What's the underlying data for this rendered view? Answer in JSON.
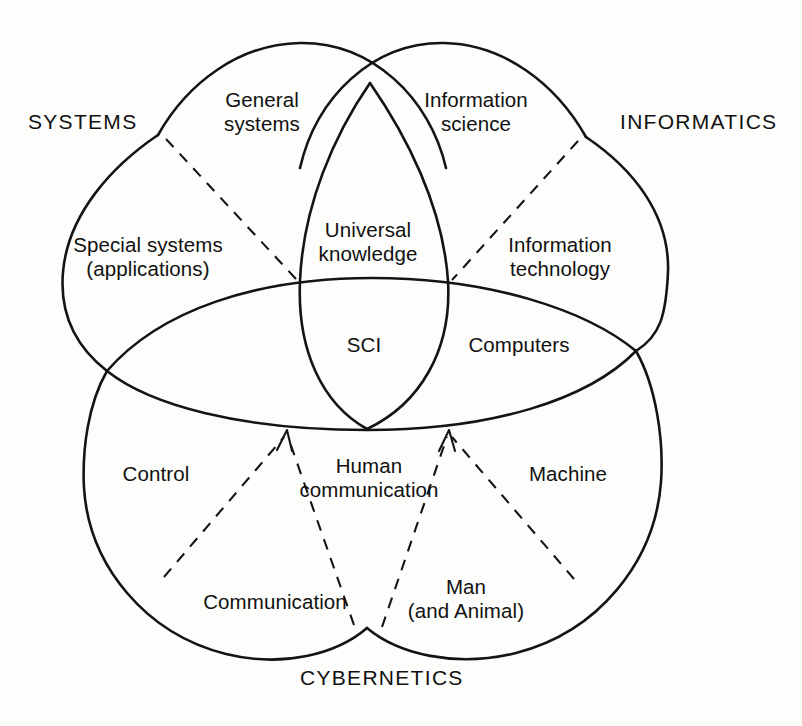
{
  "figure": {
    "type": "venn-diagram",
    "background_color": "#fdfdfb",
    "stroke_color": "#141414"
  },
  "domains": [
    {
      "id": "systems",
      "label": "SYSTEMS",
      "x": 28,
      "y": 110,
      "align": "left"
    },
    {
      "id": "informatics",
      "label": "INFORMATICS",
      "x": 620,
      "y": 110,
      "align": "left"
    },
    {
      "id": "cybernetics",
      "label": "CYBERNETICS",
      "x": 300,
      "y": 666,
      "align": "left"
    }
  ],
  "regions": [
    {
      "id": "general-systems",
      "label": "General\nsystems",
      "cx": 262,
      "cy": 113
    },
    {
      "id": "information-science",
      "label": "Information\nscience",
      "cx": 476,
      "cy": 113
    },
    {
      "id": "special-systems",
      "label": "Special systems\n(applications)",
      "cx": 148,
      "cy": 258
    },
    {
      "id": "universal-knowledge",
      "label": "Universal\nknowledge",
      "cx": 368,
      "cy": 243
    },
    {
      "id": "information-technology",
      "label": "Information\ntechnology",
      "cx": 560,
      "cy": 258
    },
    {
      "id": "sci",
      "label": "SCI",
      "cx": 364,
      "cy": 345
    },
    {
      "id": "computers",
      "label": "Computers",
      "cx": 519,
      "cy": 345
    },
    {
      "id": "control",
      "label": "Control",
      "cx": 156,
      "cy": 474
    },
    {
      "id": "human-communication",
      "label": "Human\ncommunication",
      "cx": 369,
      "cy": 479
    },
    {
      "id": "machine",
      "label": "Machine",
      "cx": 568,
      "cy": 474
    },
    {
      "id": "communication",
      "label": "Communication",
      "cx": 275,
      "cy": 602
    },
    {
      "id": "man-and-animal",
      "label": "Man\n(and Animal)",
      "cx": 466,
      "cy": 598
    }
  ],
  "connectors": [
    {
      "id": "systems-divider",
      "kind": "dashed-line",
      "from": "systems-boundary",
      "to": "left-lens-apex"
    },
    {
      "id": "informatics-divider",
      "kind": "dashed-line",
      "from": "informatics-boundary",
      "to": "right-lens-apex"
    },
    {
      "id": "control-arrow",
      "kind": "dashed-arrow",
      "from": "cybernetics-left-edge",
      "to": "lens-lower-left"
    },
    {
      "id": "communication-arrow",
      "kind": "dashed-arrow",
      "from": "cybernetics-bottom",
      "to": "lens-lower-left"
    },
    {
      "id": "man-arrow",
      "kind": "dashed-arrow",
      "from": "cybernetics-bottom",
      "to": "lens-lower-right"
    },
    {
      "id": "machine-arrow",
      "kind": "dashed-arrow",
      "from": "cybernetics-right-edge",
      "to": "lens-lower-right"
    }
  ]
}
